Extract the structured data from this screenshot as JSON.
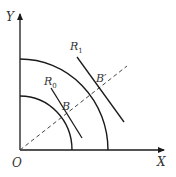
{
  "diagram": {
    "type": "isoquant-expansion-path",
    "labels": {
      "y_axis": "Y",
      "x_axis": "X",
      "origin": "O",
      "curve_inner": "R",
      "curve_inner_sub": "0",
      "curve_outer": "R",
      "curve_outer_sub": "1",
      "point_inner": "B",
      "point_outer": "B′"
    },
    "colors": {
      "stroke": "#1a1a1a",
      "text": "#333333",
      "dashed": "#444444"
    }
  }
}
